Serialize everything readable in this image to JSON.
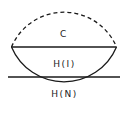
{
  "diagram": {
    "shape": "circle",
    "colors": {
      "stroke": "#1a1a1a",
      "background": "#ffffff",
      "text": "#222222"
    },
    "regions": [
      {
        "id": "c",
        "label": "C",
        "boundary": "dashed upper arc"
      },
      {
        "id": "hi",
        "label": "H(I)",
        "boundary": "band between two horizontal chords"
      },
      {
        "id": "hn",
        "label": "H(N)",
        "boundary": "solid lower arc"
      }
    ]
  }
}
